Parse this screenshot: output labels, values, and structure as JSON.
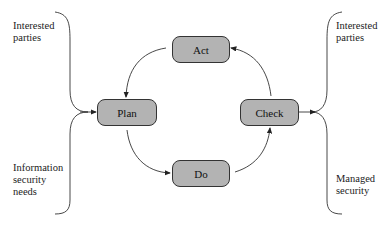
{
  "diagram": {
    "nodes": [
      {
        "id": "act",
        "label": "Act"
      },
      {
        "id": "plan",
        "label": "Plan"
      },
      {
        "id": "check",
        "label": "Check"
      },
      {
        "id": "do",
        "label": "Do"
      }
    ],
    "inputs": {
      "top": [
        "Interested",
        "parties"
      ],
      "bottom": [
        "Information",
        "security",
        "needs"
      ]
    },
    "outputs": {
      "top": [
        "Interested",
        "parties"
      ],
      "bottom": [
        "Managed",
        "security"
      ]
    },
    "colors": {
      "node_fill": "#b3b3b3",
      "stroke": "#333333"
    }
  }
}
